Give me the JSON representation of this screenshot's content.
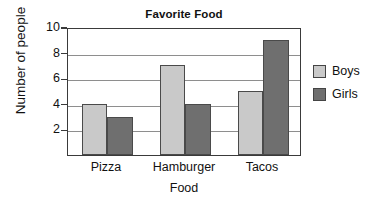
{
  "chart_data": {
    "type": "bar",
    "title": "Favorite Food",
    "xlabel": "Food",
    "ylabel": "Number of people",
    "categories": [
      "Pizza",
      "Hamburger",
      "Tacos"
    ],
    "series": [
      {
        "name": "Boys",
        "values": [
          4,
          7,
          5
        ],
        "color": "#c9c9c9"
      },
      {
        "name": "Girls",
        "values": [
          3,
          4,
          9
        ],
        "color": "#6f6f6f"
      }
    ],
    "ylim": [
      0,
      10
    ],
    "yticks": [
      2,
      4,
      6,
      8,
      10
    ],
    "ytick_labels": [
      "2",
      "4",
      "6",
      "8",
      "10"
    ],
    "grid": true,
    "grid_axis": "y",
    "legend_position": "right",
    "legend": [
      "Boys",
      "Girls"
    ]
  }
}
